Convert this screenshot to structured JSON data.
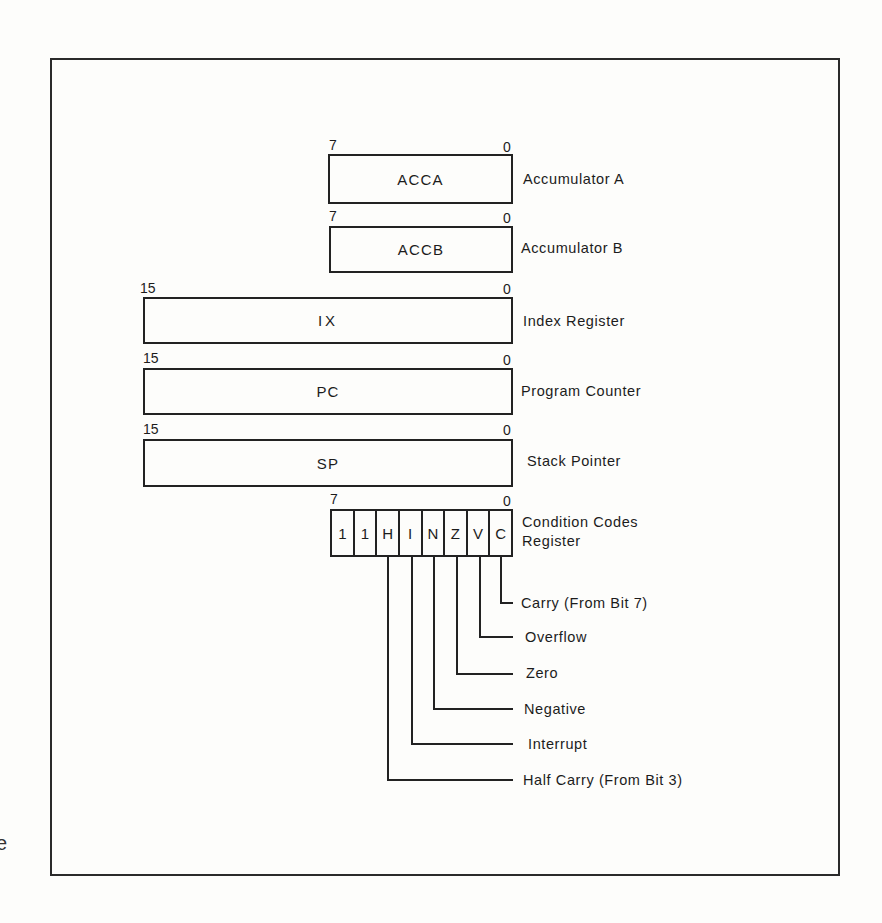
{
  "diagram": {
    "registers": [
      {
        "id": "acca",
        "name": "ACCA",
        "high_bit": "7",
        "low_bit": "0",
        "description": "Accumulator A"
      },
      {
        "id": "accb",
        "name": "ACCB",
        "high_bit": "7",
        "low_bit": "0",
        "description": "Accumulator B"
      },
      {
        "id": "ix",
        "name": "IX",
        "high_bit": "15",
        "low_bit": "0",
        "description": "Index Register"
      },
      {
        "id": "pc",
        "name": "PC",
        "high_bit": "15",
        "low_bit": "0",
        "description": "Program Counter"
      },
      {
        "id": "sp",
        "name": "SP",
        "high_bit": "15",
        "low_bit": "0",
        "description": "Stack Pointer"
      }
    ],
    "condition_codes": {
      "high_bit": "7",
      "low_bit": "0",
      "description_line1": "Condition Codes",
      "description_line2": "Register",
      "cells": [
        "1",
        "1",
        "H",
        "I",
        "N",
        "Z",
        "V",
        "C"
      ],
      "flags": [
        {
          "bit": "C",
          "label": "Carry (From Bit 7)"
        },
        {
          "bit": "V",
          "label": "Overflow"
        },
        {
          "bit": "Z",
          "label": "Zero"
        },
        {
          "bit": "N",
          "label": "Negative"
        },
        {
          "bit": "I",
          "label": "Interrupt"
        },
        {
          "bit": "H",
          "label": "Half Carry (From Bit 3)"
        }
      ]
    },
    "stray_margin_char": "e",
    "colors": {
      "ink": "#222222",
      "paper": "#fdfdfb"
    }
  }
}
